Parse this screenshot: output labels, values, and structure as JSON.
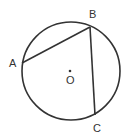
{
  "diagram": {
    "type": "circle-geometry",
    "circle": {
      "cx": 71,
      "cy": 71,
      "r": 49,
      "stroke": "#333333"
    },
    "center": {
      "label": "O",
      "x": 70,
      "y": 71
    },
    "points": [
      {
        "label": "A",
        "x": 22,
        "y": 63,
        "label_x": 9,
        "label_y": 67
      },
      {
        "label": "B",
        "x": 90,
        "y": 27,
        "label_x": 89,
        "label_y": 18
      },
      {
        "label": "C",
        "x": 95,
        "y": 115,
        "label_x": 93,
        "label_y": 132
      }
    ],
    "chords": [
      {
        "from": "A",
        "to": "B"
      },
      {
        "from": "B",
        "to": "C"
      }
    ]
  }
}
